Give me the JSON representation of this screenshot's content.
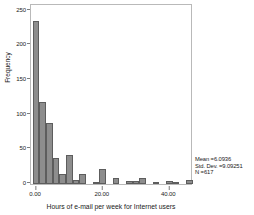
{
  "chart_data": {
    "type": "bar",
    "title": "",
    "subtitle": "",
    "xlabel": "Hours of e-mail per week for Internet users",
    "ylabel": "Frequency",
    "xlim": [
      -1.5,
      46.5
    ],
    "ylim": [
      0,
      258
    ],
    "grid": false,
    "legend_position": "none",
    "bin_width": 2,
    "bar_color": "#8d8d8d",
    "bar_edge_color": "#5d5d5d",
    "x_ticks": [
      {
        "value": 0,
        "label": "0.00"
      },
      {
        "value": 20,
        "label": "20.00"
      },
      {
        "value": 40,
        "label": "40.00"
      }
    ],
    "y_ticks": [
      {
        "value": 0,
        "label": "0"
      },
      {
        "value": 50,
        "label": "50"
      },
      {
        "value": 100,
        "label": "100"
      },
      {
        "value": 150,
        "label": "150"
      },
      {
        "value": 200,
        "label": "200"
      },
      {
        "value": 250,
        "label": "250"
      }
    ],
    "bins": [
      {
        "x": 0,
        "value": 235
      },
      {
        "x": 2,
        "value": 118
      },
      {
        "x": 4,
        "value": 88
      },
      {
        "x": 6,
        "value": 37
      },
      {
        "x": 8,
        "value": 15
      },
      {
        "x": 10,
        "value": 42
      },
      {
        "x": 12,
        "value": 6
      },
      {
        "x": 14,
        "value": 15
      },
      {
        "x": 16,
        "value": 0
      },
      {
        "x": 18,
        "value": 1
      },
      {
        "x": 20,
        "value": 21
      },
      {
        "x": 22,
        "value": 0
      },
      {
        "x": 24,
        "value": 8
      },
      {
        "x": 26,
        "value": 0
      },
      {
        "x": 28,
        "value": 4
      },
      {
        "x": 30,
        "value": 5
      },
      {
        "x": 32,
        "value": 9
      },
      {
        "x": 34,
        "value": 0
      },
      {
        "x": 36,
        "value": 3
      },
      {
        "x": 38,
        "value": 0
      },
      {
        "x": 40,
        "value": 4
      },
      {
        "x": 42,
        "value": 3
      },
      {
        "x": 44,
        "value": 0
      },
      {
        "x": 46,
        "value": 6
      }
    ],
    "annotations": {
      "mean": "Mean =6.0936",
      "std_dev": "Std. Dev. =9.09251",
      "n": "N =617"
    }
  }
}
